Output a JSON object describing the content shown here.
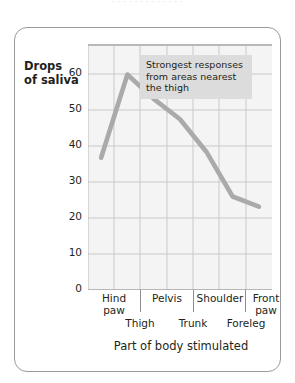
{
  "top_clipped_text": "· · ·   ·   · ·   ·   · · ·   · ·   ·",
  "figure": {
    "frame_color": "#9a9a9a",
    "plot_background": "#f4f4f4",
    "gridline_color": "#c9c9c9",
    "line_color": "#aaaaaa",
    "annotation_background": "#dcdcdc"
  },
  "annotation": {
    "line1": "Strongest responses",
    "line2": "from areas nearest",
    "line3": "the thigh"
  },
  "chart_data": {
    "type": "line",
    "title": "",
    "xlabel": "Part of body stimulated",
    "ylabel": "Drops of saliva",
    "ylim": [
      0,
      60
    ],
    "yticks": [
      0,
      10,
      20,
      30,
      40,
      50,
      60
    ],
    "ytick_labels": [
      "0",
      "10",
      "20",
      "30",
      "40",
      "50",
      "60"
    ],
    "grid": true,
    "legend": "none",
    "categories": [
      "Hind paw",
      "Thigh",
      "Pelvis",
      "Trunk",
      "Shoulder",
      "Foreleg",
      "Front paw"
    ],
    "x_labels_row1": [
      "Hind paw",
      "Pelvis",
      "Shoulder",
      "Front paw"
    ],
    "x_labels_row2": [
      "Thigh",
      "Trunk",
      "Foreleg"
    ],
    "values": [
      32.5,
      53,
      47,
      42,
      34,
      23,
      20.5
    ],
    "series": [
      {
        "name": "Drops of saliva",
        "values": [
          32.5,
          53,
          47,
          42,
          34,
          23,
          20.5
        ]
      }
    ]
  }
}
